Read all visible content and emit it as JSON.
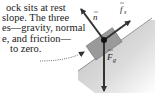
{
  "caption": {
    "lines": [
      "ock sits at rest",
      "slope.  The three",
      "es—gravity, normal",
      "e, and friction—",
      "to zero."
    ]
  },
  "diagram": {
    "labels": {
      "normal": "n",
      "friction": "f",
      "friction_sub": "s",
      "gravity": "F",
      "gravity_sub": "g"
    },
    "colors": {
      "incline": "#c8c8c8",
      "block": "#9a9a9a",
      "arrow": "#333333",
      "text": "#222222"
    }
  }
}
